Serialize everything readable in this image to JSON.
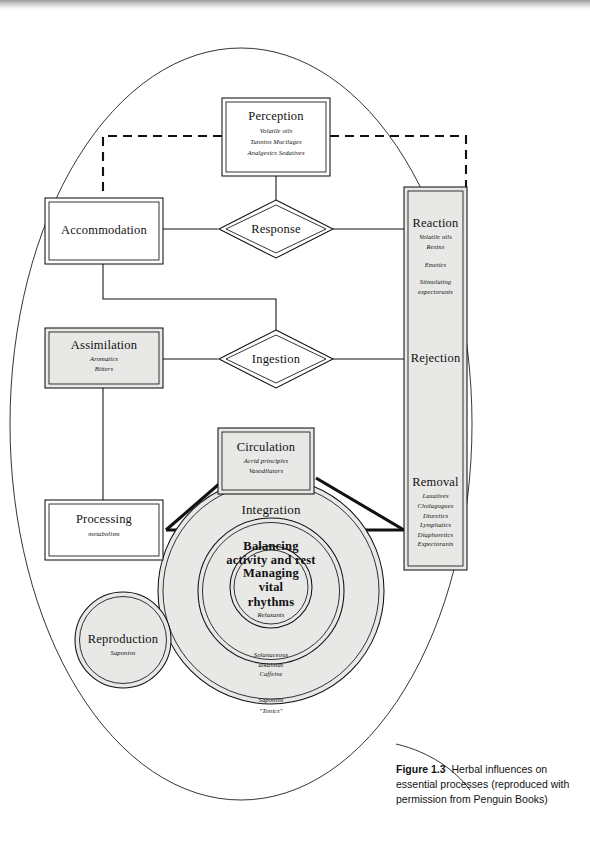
{
  "figure": {
    "caption_label": "Figure 1.3",
    "caption_text": "Herbal influences on essential processes (reproduced with permission from Penguin Books)"
  },
  "colors": {
    "ink": "#111111",
    "shaded_fill": "#e8e8e6",
    "white_fill": "#ffffff",
    "page": "#ffffff"
  },
  "nodes": {
    "perception": {
      "title": "Perception",
      "lines": [
        "Volatile oils",
        "Tannins  Mucilages",
        "Analgesics  Sedatives"
      ],
      "shape": "double-rect",
      "fill": "white"
    },
    "accommodation": {
      "title": "Accommodation",
      "lines": [],
      "shape": "double-rect",
      "fill": "white"
    },
    "response": {
      "title": "Response",
      "shape": "double-diamond",
      "fill": "white"
    },
    "ingestion": {
      "title": "Ingestion",
      "shape": "double-diamond",
      "fill": "white"
    },
    "assimilation": {
      "title": "Assimilation",
      "lines": [
        "Aromatics",
        "Bitters"
      ],
      "shape": "double-rect",
      "fill": "shaded"
    },
    "processing": {
      "title": "Processing",
      "lines": [
        "metabolism"
      ],
      "shape": "double-rect",
      "fill": "white"
    },
    "circulation": {
      "title": "Circulation",
      "lines": [
        "Acrid principles",
        "Vasodilators"
      ],
      "shape": "double-rect",
      "fill": "shaded"
    },
    "right_column": {
      "shape": "double-rect-tall",
      "fill": "shaded",
      "sections": [
        {
          "title": "Reaction",
          "lines": [
            "Volatile oils",
            "Resins",
            "",
            "Emetics",
            "",
            "Stimulating",
            "expectorants"
          ]
        },
        {
          "title": "Rejection",
          "lines": []
        },
        {
          "title": "Removal",
          "lines": [
            "Laxatives",
            "Cholagogues",
            "Diuretics",
            "Lymphatics",
            "Diaphoretics",
            "Expectorants"
          ]
        }
      ]
    },
    "integration": {
      "title": "Integration",
      "shape": "double-circle",
      "fill": "shaded"
    },
    "balancing": {
      "title_line1": "Balancing",
      "title_line2": "activity and rest",
      "shape": "double-circle",
      "fill": "shaded"
    },
    "managing": {
      "title_line1": "Managing",
      "title_line2": "vital",
      "title_line3": "rhythms",
      "sub": "Relaxants",
      "shape": "double-circle",
      "fill": "shaded"
    },
    "reproduction": {
      "title": "Reproduction",
      "lines": [
        "Saponins"
      ],
      "shape": "double-circle",
      "fill": "shaded"
    },
    "ring_mid_labels": [
      "Solanaceous",
      "alkaloids",
      "Caffeine"
    ],
    "ring_outer_labels": [
      "Saponins",
      "\"Tonics\""
    ]
  },
  "connectors": {
    "perception_to_accommodation": "dashed",
    "perception_to_right_column": "dashed",
    "perception_to_response": "solid",
    "accommodation_to_response": "solid",
    "response_to_right_column": "solid",
    "accommodation_to_ingestion": "solid",
    "assimilation_to_ingestion": "solid",
    "ingestion_to_right_column": "solid",
    "assimilation_to_processing": "solid",
    "processing_to_circulation": "thick",
    "processing_to_removal": "thick",
    "circulation_to_removal": "thick"
  },
  "outer_shape": {
    "type": "ellipse",
    "description": "large enclosing oval"
  }
}
